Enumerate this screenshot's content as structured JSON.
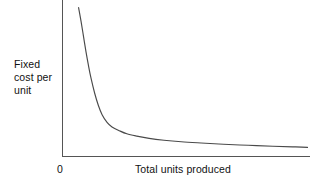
{
  "chart_data": {
    "type": "line",
    "title": "",
    "subtitle": "",
    "xlabel": "Total units produced",
    "ylabel_lines": [
      "Fixed",
      "cost per",
      "unit"
    ],
    "ylabel": "Fixed cost per unit",
    "origin_tick": "0",
    "grid": false,
    "legend": null,
    "axis_ticks": {
      "x": [
        "0"
      ],
      "y": []
    },
    "xlim": [
      0,
      100
    ],
    "ylim": [
      0,
      100
    ],
    "series": [
      {
        "name": "Fixed cost per unit",
        "color": "#4a4a4a",
        "description": "Hyperbolic decay curve: fixed cost per unit falls steeply then flattens asymptotically toward zero as total units produced increases",
        "points": [
          [
            6.5,
            97.0
          ],
          [
            7.5,
            88.0
          ],
          [
            8.5,
            78.0
          ],
          [
            9.5,
            68.0
          ],
          [
            10.5,
            59.0
          ],
          [
            11.5,
            51.0
          ],
          [
            13.0,
            41.0
          ],
          [
            14.5,
            33.0
          ],
          [
            16.0,
            27.0
          ],
          [
            18.0,
            22.0
          ],
          [
            20.0,
            19.0
          ],
          [
            23.0,
            16.5
          ],
          [
            26.0,
            14.5
          ],
          [
            30.0,
            13.0
          ],
          [
            35.0,
            11.5
          ],
          [
            41.0,
            10.3
          ],
          [
            48.0,
            9.3
          ],
          [
            56.0,
            8.5
          ],
          [
            65.0,
            7.7
          ],
          [
            75.0,
            7.0
          ],
          [
            85.0,
            6.4
          ],
          [
            93.0,
            6.0
          ],
          [
            99.0,
            5.6
          ]
        ]
      }
    ],
    "colors": {
      "background": "#ffffff",
      "axis": "#555555",
      "curve": "#4a4a4a",
      "text": "#111111"
    }
  },
  "annotations": []
}
